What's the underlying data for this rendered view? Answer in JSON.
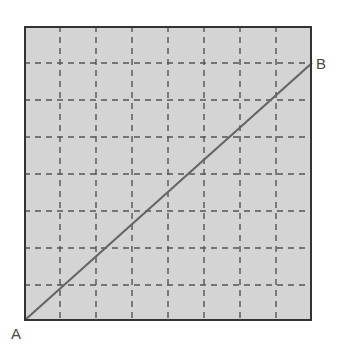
{
  "figure": {
    "background_color": "#ffffff",
    "labels": {
      "a": "A",
      "b": "B"
    },
    "label_color": "#4a4a4a"
  },
  "chart_data": {
    "type": "line",
    "xlabel": "",
    "ylabel": "",
    "xlim": [
      0,
      8
    ],
    "ylim": [
      0,
      8
    ],
    "grid": true,
    "grid_style": "dashed",
    "grid_columns": 8,
    "grid_rows": 8,
    "legend": "none",
    "annotations": [
      {
        "text": "A",
        "x": 0,
        "y": 0,
        "position": "bottom-left-outside"
      },
      {
        "text": "B",
        "x": 8,
        "y": 7,
        "position": "right-outside"
      }
    ],
    "series": [
      {
        "name": "AB",
        "x": [
          0,
          8
        ],
        "y": [
          0,
          7
        ],
        "color": "#666666",
        "style": "solid",
        "width": 2
      }
    ]
  },
  "geometry": {
    "plot_area": {
      "left": 24,
      "top": 26,
      "width": 288,
      "height": 295
    },
    "border_color": "#333333",
    "border_width": 2,
    "fill_color": "#d4d4d4",
    "grid_color": "#555555",
    "grid_dash": "6,5",
    "grid_width": 1.4,
    "vertical_gridlines": [
      60,
      96,
      132,
      168,
      204,
      240,
      276
    ],
    "horizontal_gridlines": [
      63,
      100,
      137,
      174,
      211,
      248,
      285
    ],
    "line_color": "#666666",
    "line_width": 2.2,
    "line_start": {
      "x": 25,
      "y": 320
    },
    "line_end": {
      "x": 312,
      "y": 63
    }
  }
}
